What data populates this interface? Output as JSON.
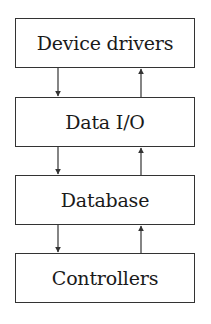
{
  "diagram": {
    "type": "layered-stack",
    "layers": [
      {
        "label": "Device drivers",
        "top": 18
      },
      {
        "label": "Data I/O",
        "top": 97
      },
      {
        "label": "Database",
        "top": 175
      },
      {
        "label": "Controllers",
        "top": 253
      }
    ],
    "connections": [
      {
        "from": "Device drivers",
        "to": "Data I/O",
        "direction": "down"
      },
      {
        "from": "Data I/O",
        "to": "Device drivers",
        "direction": "up"
      },
      {
        "from": "Data I/O",
        "to": "Database",
        "direction": "down"
      },
      {
        "from": "Database",
        "to": "Data I/O",
        "direction": "up"
      },
      {
        "from": "Database",
        "to": "Controllers",
        "direction": "down"
      },
      {
        "from": "Controllers",
        "to": "Database",
        "direction": "up"
      }
    ],
    "colors": {
      "stroke": "#333333",
      "text": "#1a1a1a",
      "background": "#ffffff"
    }
  }
}
